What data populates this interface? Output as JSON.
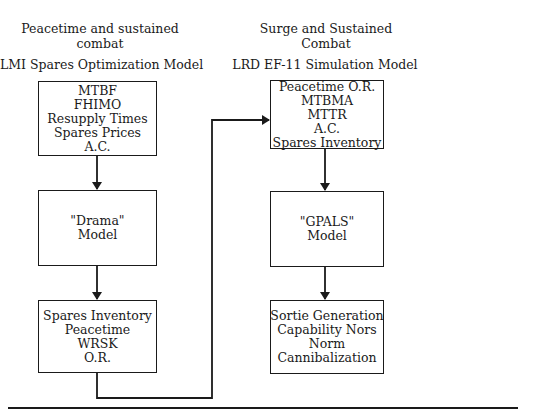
{
  "left_column": {
    "scenario": [
      "Peacetime and sustained",
      "combat"
    ],
    "model_title": "LMI Spares Optimization Model",
    "boxes": [
      {
        "lines": [
          "MTBF",
          "FHIMO",
          "Resupply Times",
          "Spares Prices",
          "A.C."
        ]
      },
      {
        "lines": [
          "\"Drama\"",
          "Model"
        ]
      },
      {
        "lines": [
          "Spares Inventory",
          "Peacetime",
          "WRSK",
          "O.R."
        ]
      }
    ]
  },
  "right_column": {
    "scenario": [
      "Surge and Sustained",
      "Combat"
    ],
    "model_title": "LRD EF-11 Simulation Model",
    "boxes": [
      {
        "lines": [
          "Peacetime O.R.",
          "MTBMA",
          "MTTR",
          "A.C.",
          "Spares Inventory"
        ]
      },
      {
        "lines": [
          "\"GPALS\"",
          "Model"
        ]
      },
      {
        "lines": [
          "Sortie Generation",
          "Capability Nors",
          "Norm",
          "Cannibalization"
        ]
      }
    ]
  },
  "connectors": [
    {
      "from": "left_column.boxes.0",
      "to": "left_column.boxes.1"
    },
    {
      "from": "left_column.boxes.1",
      "to": "left_column.boxes.2"
    },
    {
      "from": "left_column.boxes.2",
      "to": "right_column.boxes.0"
    },
    {
      "from": "right_column.boxes.0",
      "to": "right_column.boxes.1"
    },
    {
      "from": "right_column.boxes.1",
      "to": "right_column.boxes.2"
    }
  ],
  "colors": {
    "line": "#1a1a1a",
    "background": "#ffffff"
  }
}
